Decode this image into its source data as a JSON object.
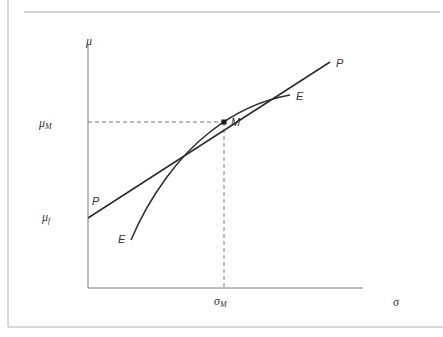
{
  "figure": {
    "type": "capital-market-line-diagram",
    "axes": {
      "y_label": "μ",
      "x_label": "σ",
      "y_ticks": [
        {
          "base": "μ",
          "sub": "M"
        },
        {
          "base": "μ",
          "sub": "f"
        }
      ],
      "x_ticks": [
        {
          "base": "σ",
          "sub": "M"
        }
      ]
    },
    "curves": {
      "line_label_start": "P",
      "line_label_end": "P",
      "frontier_label_start": "E",
      "frontier_label_end": "E"
    },
    "point": {
      "label": "M"
    },
    "colors": {
      "line": "#2b2b2b",
      "axis": "#777777",
      "frame": "#b0b0b0",
      "dashed": "#777777",
      "text": "#333333"
    }
  }
}
